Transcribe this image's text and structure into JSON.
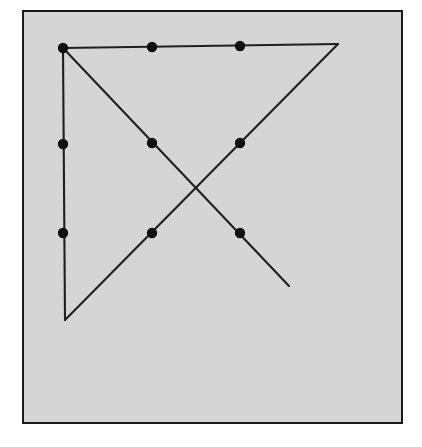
{
  "figure": {
    "canvas": {
      "width": 422,
      "height": 447
    },
    "colors": {
      "page_background": "#ffffff",
      "panel_fill": "#d5d5d5",
      "panel_border": "#1a1a1a",
      "line": "#1f1f1f",
      "dot": "#111111"
    },
    "panel": {
      "name": "gray-panel",
      "x": 23,
      "y": 11,
      "width": 379,
      "height": 412,
      "stroke_width": 2
    },
    "line_style": {
      "stroke_width": 2.1,
      "cap": "round"
    },
    "dot_radius": 5.2,
    "vertices": {
      "top_left": {
        "label": "A",
        "x": 63,
        "y": 48
      },
      "top_right": {
        "label": "B",
        "x": 338,
        "y": 44
      },
      "bottom_left": {
        "label": "C",
        "x": 65,
        "y": 320
      },
      "diagonal_end": {
        "label": "D",
        "x": 289,
        "y": 286
      },
      "crossing": {
        "label": "X",
        "x": 196,
        "y": 188
      }
    },
    "segments": [
      {
        "name": "top-edge",
        "from": "A",
        "to": "B",
        "x1": 63,
        "y1": 48,
        "x2": 338,
        "y2": 44
      },
      {
        "name": "left-edge",
        "from": "A",
        "to": "C",
        "x1": 63,
        "y1": 48,
        "x2": 65,
        "y2": 320
      },
      {
        "name": "descending-diagonal",
        "from": "A",
        "to": "D",
        "x1": 63,
        "y1": 48,
        "x2": 289,
        "y2": 286
      },
      {
        "name": "ascending-diagonal",
        "from": "C",
        "to": "B",
        "x1": 65,
        "y1": 320,
        "x2": 338,
        "y2": 44
      }
    ],
    "markers": [
      {
        "name": "marker-top-left-corner",
        "x": 63,
        "y": 48,
        "on": "top-edge"
      },
      {
        "name": "marker-top-edge-1",
        "x": 152,
        "y": 47,
        "on": "top-edge"
      },
      {
        "name": "marker-top-edge-2",
        "x": 240,
        "y": 46,
        "on": "top-edge"
      },
      {
        "name": "marker-left-edge-1",
        "x": 63,
        "y": 144,
        "on": "left-edge"
      },
      {
        "name": "marker-left-edge-2",
        "x": 63,
        "y": 233,
        "on": "left-edge"
      },
      {
        "name": "marker-descending-1",
        "x": 152,
        "y": 143,
        "on": "descending-diagonal"
      },
      {
        "name": "marker-descending-2",
        "x": 240,
        "y": 233,
        "on": "descending-diagonal"
      },
      {
        "name": "marker-ascending-1",
        "x": 240,
        "y": 143,
        "on": "ascending-diagonal"
      },
      {
        "name": "marker-ascending-2",
        "x": 152,
        "y": 233,
        "on": "ascending-diagonal"
      }
    ]
  }
}
